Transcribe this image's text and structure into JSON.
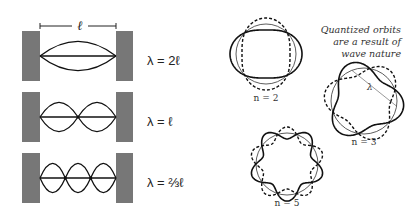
{
  "standing_waves": {
    "length_label": "ℓ",
    "modes": [
      {
        "loops": 1,
        "label": "λ = 2ℓ"
      },
      {
        "loops": 2,
        "label": "λ = ℓ"
      },
      {
        "loops": 3,
        "label": "λ = ⅔ℓ"
      }
    ]
  },
  "orbits": {
    "caption_lines": [
      "Quantized orbits",
      "are a result of",
      "wave nature"
    ],
    "diagrams": [
      {
        "n": 2,
        "label": "n = 2"
      },
      {
        "n": 3,
        "label": "n = 3",
        "wavelength_symbol": "λ"
      },
      {
        "n": 5,
        "label": "n = 5"
      }
    ]
  },
  "colors": {
    "wall": "#777777",
    "line": "#111111",
    "text": "#222222"
  }
}
